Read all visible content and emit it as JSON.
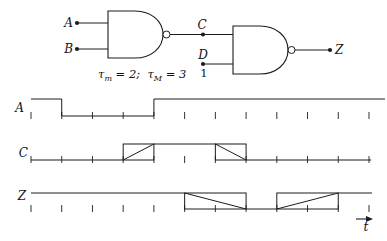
{
  "circuit": {
    "gate1": {
      "type": "NAND2"
    },
    "gate2": {
      "type": "NAND2"
    },
    "labels": {
      "input_a": "A",
      "input_b": "B",
      "net_c": "C",
      "input_d": "D",
      "d_constant": "1",
      "output_z": "Z"
    },
    "delay_annotation": {
      "p1": "τ",
      "p2": "m",
      "p3": " = 2;  τ",
      "p4": "M",
      "p5": " = 3",
      "plain_text": "τm = 2;  τM = 3"
    }
  },
  "timing": {
    "axis_label": "t",
    "unit_ticks": 12,
    "tau_min": 2,
    "tau_max": 3,
    "waveforms": [
      {
        "label": "A",
        "segments": [
          [
            "high",
            0,
            1
          ],
          [
            "low",
            1,
            4
          ],
          [
            "high",
            4,
            11.52
          ]
        ]
      },
      {
        "label": "C",
        "segments": [
          [
            "low",
            0,
            3
          ],
          [
            "rise",
            3,
            4
          ],
          [
            "high",
            4,
            6
          ],
          [
            "fall",
            6,
            7
          ],
          [
            "low",
            7,
            11.07
          ]
        ]
      },
      {
        "label": "Z",
        "segments": [
          [
            "high",
            0,
            5
          ],
          [
            "fall",
            5,
            7
          ],
          [
            "low",
            7,
            8
          ],
          [
            "rise",
            8,
            10
          ],
          [
            "high",
            10,
            11.1
          ]
        ]
      }
    ]
  }
}
